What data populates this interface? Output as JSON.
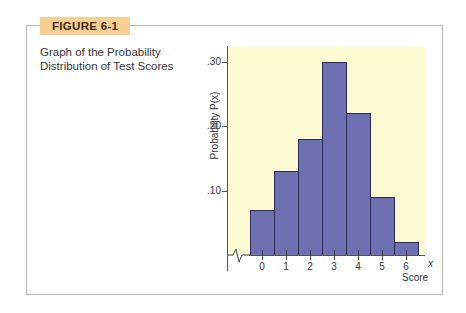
{
  "figure": {
    "label": "FIGURE 6-1",
    "caption_line1": "Graph of the Probability",
    "caption_line2": "Distribution of Test Scores",
    "label_color": "#f7cf95",
    "bar_color": "#6e6fb0",
    "plot_bg_color": "#fdfbd2"
  },
  "chart_data": {
    "type": "bar",
    "title": "Graph of the Probability Distribution of Test Scores",
    "xlabel": "Score",
    "xvar": "x",
    "ylabel": "Probability P(x)",
    "categories": [
      "0",
      "1",
      "2",
      "3",
      "4",
      "5",
      "6"
    ],
    "values": [
      0.07,
      0.13,
      0.18,
      0.3,
      0.22,
      0.09,
      0.02
    ],
    "yticks": [
      ".10",
      ".20",
      ".30"
    ],
    "ylim": [
      0,
      0.33
    ],
    "grid": false,
    "legend": null,
    "axis_break": true
  }
}
